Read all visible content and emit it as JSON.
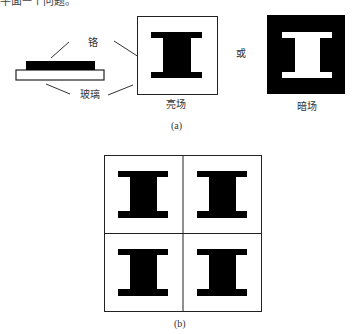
{
  "figure": {
    "top_cut_text": "平面ㅡ个问题。",
    "part_a": {
      "labels": {
        "chromium": "铬",
        "glass": "玻璃",
        "bright_field": "亮场",
        "or": "或",
        "dark_field": "暗场"
      },
      "caption": "(a)"
    },
    "part_b": {
      "grid_rows": 2,
      "grid_cols": 2,
      "caption": "(b)"
    },
    "colors": {
      "ink": "#000000",
      "line": "#333333",
      "background": "#ffffff"
    }
  }
}
